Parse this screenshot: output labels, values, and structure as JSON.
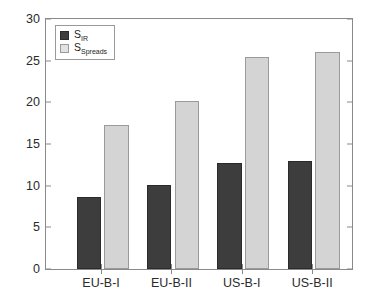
{
  "chart_data": {
    "type": "bar",
    "title": "",
    "xlabel": "",
    "ylabel": "",
    "categories": [
      "EU-B-I",
      "EU-B-II",
      "US-B-I",
      "US-B-II"
    ],
    "series": [
      {
        "name": "S_IR",
        "label_base": "S",
        "label_sub": "IR",
        "color": "#3d3d3d",
        "values": [
          8.6,
          10.1,
          12.7,
          13.0
        ]
      },
      {
        "name": "S_Spreads",
        "label_base": "S",
        "label_sub": "Spreads",
        "color": "#d4d4d4",
        "values": [
          17.3,
          20.2,
          25.5,
          26.0
        ]
      }
    ],
    "ylim": [
      0,
      30
    ],
    "yticks": [
      0,
      5,
      10,
      15,
      20,
      25,
      30
    ],
    "ytick_labels": [
      "0",
      "5",
      "10",
      "15",
      "20",
      "25",
      "30"
    ],
    "grid": false,
    "legend_position": "upper-left",
    "axis_color": "#8a8a8a",
    "background": "#ffffff"
  }
}
